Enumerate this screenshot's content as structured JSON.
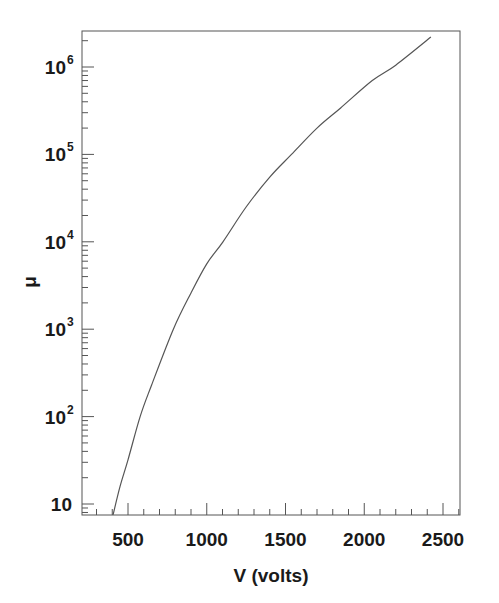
{
  "chart_data": {
    "type": "line",
    "title": "",
    "xlabel": "V (volts)",
    "ylabel": "μ",
    "xscale": "linear",
    "yscale": "log",
    "xlim": [
      210,
      2610
    ],
    "ylim": [
      7.5,
      2600000.0
    ],
    "grid": false,
    "legend": null,
    "x_ticks": [
      500,
      1000,
      1500,
      2000,
      2500
    ],
    "x_tick_labels": [
      "500",
      "1000",
      "1500",
      "2000",
      "2500"
    ],
    "y_ticks": [
      10,
      100,
      1000,
      10000,
      100000,
      1000000
    ],
    "y_tick_labels": [
      {
        "base": "10",
        "exp": ""
      },
      {
        "base": "10",
        "exp": "2"
      },
      {
        "base": "10",
        "exp": "3"
      },
      {
        "base": "10",
        "exp": "4"
      },
      {
        "base": "10",
        "exp": "5"
      },
      {
        "base": "10",
        "exp": "6"
      }
    ],
    "series": [
      {
        "name": "gain vs voltage",
        "color": "#555555",
        "x": [
          405,
          450,
          500,
          577,
          650,
          788,
          900,
          1000,
          1103,
          1250,
          1400,
          1538,
          1700,
          1850,
          2051,
          2200,
          2423
        ],
        "y": [
          7.5,
          16,
          32,
          100,
          230,
          1000,
          2600,
          5600,
          10000,
          25000,
          55000,
          100000,
          200000,
          340000,
          700000,
          1050000,
          2200000
        ]
      }
    ]
  }
}
